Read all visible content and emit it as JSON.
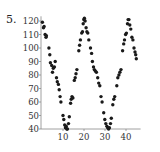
{
  "problem_number": "5.",
  "chart_data": {
    "type": "scatter",
    "title": "",
    "xlabel": "",
    "ylabel": "",
    "xlim": [
      0,
      46
    ],
    "ylim": [
      40,
      122
    ],
    "x_ticks": [
      10,
      20,
      30,
      40
    ],
    "y_ticks": [
      40,
      50,
      60,
      70,
      80,
      90,
      100,
      110,
      120
    ],
    "grid": false,
    "legend": null,
    "points": [
      [
        0.2,
        119
      ],
      [
        0.7,
        115
      ],
      [
        1.0,
        116
      ],
      [
        1.5,
        110
      ],
      [
        1.9,
        108
      ],
      [
        2.1,
        109
      ],
      [
        3.3,
        100
      ],
      [
        3.7,
        95
      ],
      [
        4.0,
        89
      ],
      [
        4.6,
        87
      ],
      [
        5.0,
        82
      ],
      [
        5.4,
        85
      ],
      [
        5.9,
        86
      ],
      [
        6.3,
        90
      ],
      [
        6.9,
        78
      ],
      [
        7.3,
        75
      ],
      [
        7.8,
        73
      ],
      [
        8.2,
        69
      ],
      [
        8.6,
        64
      ],
      [
        9.0,
        60
      ],
      [
        10.0,
        50
      ],
      [
        10.4,
        47
      ],
      [
        10.8,
        43
      ],
      [
        11.2,
        41
      ],
      [
        11.5,
        42
      ],
      [
        11.8,
        40
      ],
      [
        12.1,
        40
      ],
      [
        12.6,
        44
      ],
      [
        13.0,
        49
      ],
      [
        13.6,
        59
      ],
      [
        13.9,
        62
      ],
      [
        14.3,
        64
      ],
      [
        14.7,
        63
      ],
      [
        15.4,
        76
      ],
      [
        15.8,
        78
      ],
      [
        16.2,
        81
      ],
      [
        16.6,
        84
      ],
      [
        17.5,
        98
      ],
      [
        17.9,
        102
      ],
      [
        18.3,
        106
      ],
      [
        18.9,
        111
      ],
      [
        19.3,
        112
      ],
      [
        19.6,
        118
      ],
      [
        19.9,
        121
      ],
      [
        20.2,
        122
      ],
      [
        20.5,
        120
      ],
      [
        21.0,
        115
      ],
      [
        21.4,
        112
      ],
      [
        21.8,
        111
      ],
      [
        22.3,
        106
      ],
      [
        23.1,
        100
      ],
      [
        23.6,
        96
      ],
      [
        24.0,
        90
      ],
      [
        24.5,
        86
      ],
      [
        24.9,
        84
      ],
      [
        25.4,
        83
      ],
      [
        25.9,
        82
      ],
      [
        26.5,
        78
      ],
      [
        27.0,
        74
      ],
      [
        27.5,
        72
      ],
      [
        28.1,
        64
      ],
      [
        28.6,
        60
      ],
      [
        29.4,
        52
      ],
      [
        29.9,
        47
      ],
      [
        30.4,
        44
      ],
      [
        30.9,
        42
      ],
      [
        31.3,
        41
      ],
      [
        31.7,
        40
      ],
      [
        32.1,
        41
      ],
      [
        32.6,
        44
      ],
      [
        33.0,
        48
      ],
      [
        33.7,
        58
      ],
      [
        34.2,
        62
      ],
      [
        34.6,
        64
      ],
      [
        35.6,
        72
      ],
      [
        36.1,
        78
      ],
      [
        36.6,
        80
      ],
      [
        37.1,
        82
      ],
      [
        37.6,
        84
      ],
      [
        38.4,
        98
      ],
      [
        38.9,
        103
      ],
      [
        39.3,
        106
      ],
      [
        39.8,
        110
      ],
      [
        40.2,
        111
      ],
      [
        40.7,
        118
      ],
      [
        41.0,
        121
      ],
      [
        41.4,
        121
      ],
      [
        41.8,
        117
      ],
      [
        42.3,
        114
      ],
      [
        42.8,
        108
      ],
      [
        43.3,
        106
      ],
      [
        43.8,
        100
      ],
      [
        44.3,
        97
      ],
      [
        44.6,
        95
      ],
      [
        44.9,
        92
      ]
    ]
  }
}
